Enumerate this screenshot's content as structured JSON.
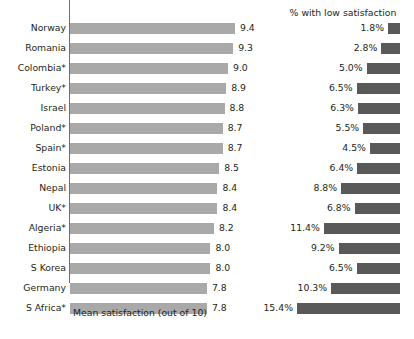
{
  "chart_data": {
    "type": "bar",
    "title": "",
    "subtitle": "",
    "orientation": "horizontal",
    "panels": [
      {
        "name": "mean-satisfaction",
        "xlabel": "Mean satisfaction (out of 10)",
        "heading": "",
        "bar_color": "#a9a9a9",
        "value_suffix": "",
        "xlim": [
          0,
          9.4
        ],
        "grid": false
      },
      {
        "name": "low-satisfaction",
        "heading": "% with low satisfaction",
        "xlabel": "",
        "bar_color": "#595959",
        "value_suffix": "%",
        "xlim": [
          0,
          15.4
        ],
        "grid": false
      }
    ],
    "categories": [
      "Norway",
      "Romania",
      "Colombia*",
      "Turkey*",
      "Israel",
      "Poland*",
      "Spain*",
      "Estonia",
      "Nepal",
      "UK*",
      "Algeria*",
      "Ethiopia",
      "S Korea",
      "Germany",
      "S Africa*"
    ],
    "series": [
      {
        "name": "Mean satisfaction (out of 10)",
        "panel": "mean-satisfaction",
        "values": [
          9.4,
          9.3,
          9.0,
          8.9,
          8.8,
          8.7,
          8.7,
          8.5,
          8.4,
          8.4,
          8.2,
          8.0,
          8.0,
          7.8,
          7.8
        ],
        "labels": [
          "9.4",
          "9.3",
          "9.0",
          "8.9",
          "8.8",
          "8.7",
          "8.7",
          "8.5",
          "8.4",
          "8.4",
          "8.2",
          "8.0",
          "8.0",
          "7.8",
          "7.8"
        ]
      },
      {
        "name": "% with low satisfaction",
        "panel": "low-satisfaction",
        "values": [
          1.8,
          2.8,
          5.0,
          6.5,
          6.3,
          5.5,
          4.5,
          6.4,
          8.8,
          6.8,
          11.4,
          9.2,
          6.5,
          10.3,
          15.4
        ],
        "labels": [
          "1.8%",
          "2.8%",
          "5.0%",
          "6.5%",
          "6.3%",
          "5.5%",
          "4.5%",
          "6.4%",
          "8.8%",
          "6.8%",
          "11.4%",
          "9.2%",
          "6.5%",
          "10.3%",
          "15.4%"
        ]
      }
    ],
    "legend": [],
    "annotations": [
      "* indicates country name marked with asterisk"
    ]
  },
  "rows": [
    {
      "category": "Norway",
      "mean_label": "9.4",
      "mean_value": 9.4,
      "pct_label": "1.8%",
      "pct_value": 1.8
    },
    {
      "category": "Romania",
      "mean_label": "9.3",
      "mean_value": 9.3,
      "pct_label": "2.8%",
      "pct_value": 2.8
    },
    {
      "category": "Colombia*",
      "mean_label": "9.0",
      "mean_value": 9.0,
      "pct_label": "5.0%",
      "pct_value": 5.0
    },
    {
      "category": "Turkey*",
      "mean_label": "8.9",
      "mean_value": 8.9,
      "pct_label": "6.5%",
      "pct_value": 6.5
    },
    {
      "category": "Israel",
      "mean_label": "8.8",
      "mean_value": 8.8,
      "pct_label": "6.3%",
      "pct_value": 6.3
    },
    {
      "category": "Poland*",
      "mean_label": "8.7",
      "mean_value": 8.7,
      "pct_label": "5.5%",
      "pct_value": 5.5
    },
    {
      "category": "Spain*",
      "mean_label": "8.7",
      "mean_value": 8.7,
      "pct_label": "4.5%",
      "pct_value": 4.5
    },
    {
      "category": "Estonia",
      "mean_label": "8.5",
      "mean_value": 8.5,
      "pct_label": "6.4%",
      "pct_value": 6.4
    },
    {
      "category": "Nepal",
      "mean_label": "8.4",
      "mean_value": 8.4,
      "pct_label": "8.8%",
      "pct_value": 8.8
    },
    {
      "category": "UK*",
      "mean_label": "8.4",
      "mean_value": 8.4,
      "pct_label": "6.8%",
      "pct_value": 6.8
    },
    {
      "category": "Algeria*",
      "mean_label": "8.2",
      "mean_value": 8.2,
      "pct_label": "11.4%",
      "pct_value": 11.4
    },
    {
      "category": "Ethiopia",
      "mean_label": "8.0",
      "mean_value": 8.0,
      "pct_label": "9.2%",
      "pct_value": 9.2
    },
    {
      "category": "S Korea",
      "mean_label": "8.0",
      "mean_value": 8.0,
      "pct_label": "6.5%",
      "pct_value": 6.5
    },
    {
      "category": "Germany",
      "mean_label": "7.8",
      "mean_value": 7.8,
      "pct_label": "10.3%",
      "pct_value": 10.3
    },
    {
      "category": "S Africa*",
      "mean_label": "7.8",
      "mean_value": 7.8,
      "pct_label": "15.4%",
      "pct_value": 15.4
    }
  ],
  "right_panel": {
    "heading": "% with low satisfaction"
  },
  "left_panel": {
    "axis_caption": "Mean satisfaction (out of 10)"
  },
  "colors": {
    "bar_left": "#a9a9a9",
    "bar_right": "#595959",
    "axis": "#6f6f6f",
    "text": "#231f20",
    "background": "#ffffff"
  }
}
